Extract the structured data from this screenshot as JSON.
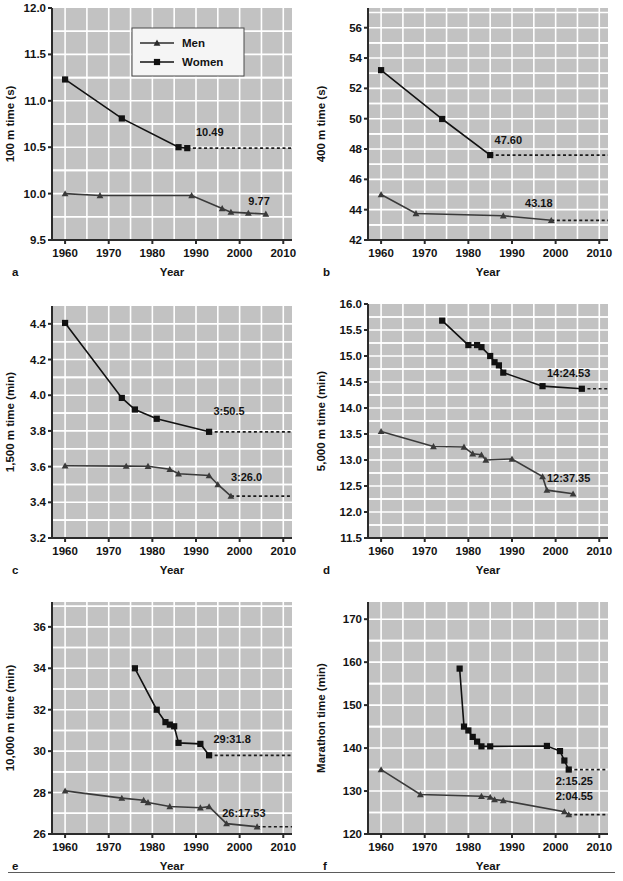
{
  "figure": {
    "title": "",
    "panel_count": 6,
    "legend": {
      "position": "inside panel a, upper area",
      "entries": [
        {
          "label": "Men",
          "marker": "triangle",
          "color": "#2b2b2b"
        },
        {
          "label": "Women",
          "marker": "square",
          "color": "#111111"
        }
      ]
    },
    "style": {
      "plot_background": "#c2c2c2",
      "grid_color": "#ffffff",
      "axis_color": "#2b2b2b",
      "men_color": "#3a3a3a",
      "women_color": "#111111",
      "dashed_color": "#1a1a1a",
      "page_background": "#ffffff",
      "rule_color": "#5b5b5b"
    }
  },
  "chart_data": [
    {
      "panel": "a",
      "type": "line",
      "title": "",
      "xlabel": "Year",
      "ylabel": "100 m time (s)",
      "xlim": [
        1957,
        2012
      ],
      "ylim": [
        9.5,
        12.0
      ],
      "xticks": [
        1960,
        1970,
        1980,
        1990,
        2000,
        2010
      ],
      "xticklabels": [
        "1960",
        "1970",
        "1980",
        "1990",
        "2000",
        "2010"
      ],
      "yticks": [
        9.5,
        10.0,
        10.5,
        11.0,
        11.5,
        12.0
      ],
      "yticklabels": [
        "9.5",
        "10.0",
        "10.5",
        "11.0",
        "11.5",
        "12.0"
      ],
      "grid": true,
      "series": [
        {
          "name": "Men",
          "marker": "triangle",
          "x": [
            1960,
            1968,
            1989,
            1996,
            1998,
            2002,
            2006
          ],
          "y": [
            10.0,
            9.98,
            9.98,
            9.84,
            9.8,
            9.79,
            9.78
          ]
        },
        {
          "name": "Women",
          "marker": "square",
          "x": [
            1960,
            1973,
            1986,
            1988
          ],
          "y": [
            11.23,
            10.81,
            10.5,
            10.49
          ]
        }
      ],
      "annotations": [
        {
          "text": "10.49",
          "x": 1990,
          "y": 10.62,
          "series": "Women"
        },
        {
          "text": "9.77",
          "x": 2002,
          "y": 9.88,
          "series": "Men"
        }
      ],
      "reference_lines": [
        {
          "y": 10.49,
          "from_x": 1988,
          "to_x": 2012,
          "style": "dashed"
        }
      ]
    },
    {
      "panel": "b",
      "type": "line",
      "title": "",
      "xlabel": "Year",
      "ylabel": "400 m time (s)",
      "xlim": [
        1957,
        2012
      ],
      "ylim": [
        42,
        57.3
      ],
      "xticks": [
        1960,
        1970,
        1980,
        1990,
        2000,
        2010
      ],
      "xticklabels": [
        "1960",
        "1970",
        "1980",
        "1990",
        "2000",
        "2010"
      ],
      "yticks": [
        42,
        44,
        46,
        48,
        50,
        52,
        54,
        56
      ],
      "yticklabels": [
        "42",
        "44",
        "46",
        "48",
        "50",
        "52",
        "54",
        "56"
      ],
      "grid": true,
      "series": [
        {
          "name": "Men",
          "marker": "triangle",
          "x": [
            1960,
            1968,
            1988,
            1999
          ],
          "y": [
            45.0,
            43.75,
            43.6,
            43.3
          ]
        },
        {
          "name": "Women",
          "marker": "square",
          "x": [
            1960,
            1974,
            1985
          ],
          "y": [
            53.2,
            49.98,
            47.6
          ]
        }
      ],
      "annotations": [
        {
          "text": "47.60",
          "x": 1986,
          "y": 48.35,
          "series": "Women"
        },
        {
          "text": "43.18",
          "x": 1993,
          "y": 44.15,
          "series": "Men"
        }
      ],
      "reference_lines": [
        {
          "y": 47.6,
          "from_x": 1985,
          "to_x": 2012,
          "style": "dashed"
        },
        {
          "y": 43.3,
          "from_x": 1999,
          "to_x": 2012,
          "style": "dashed"
        }
      ]
    },
    {
      "panel": "c",
      "type": "line",
      "title": "",
      "xlabel": "Year",
      "ylabel": "1,500 m time (min)",
      "xlim": [
        1957,
        2012
      ],
      "ylim": [
        3.2,
        4.5
      ],
      "xticks": [
        1960,
        1970,
        1980,
        1990,
        2000,
        2010
      ],
      "xticklabels": [
        "1960",
        "1970",
        "1980",
        "1990",
        "2000",
        "2010"
      ],
      "yticks": [
        3.2,
        3.4,
        3.6,
        3.8,
        4.0,
        4.2,
        4.4
      ],
      "yticklabels": [
        "3.2",
        "3.4",
        "3.6",
        "3.8",
        "4.0",
        "4.2",
        "4.4"
      ],
      "grid": true,
      "series": [
        {
          "name": "Men",
          "marker": "triangle",
          "x": [
            1960,
            1974,
            1979,
            1984,
            1986,
            1993,
            1995,
            1998
          ],
          "y": [
            3.605,
            3.603,
            3.602,
            3.585,
            3.56,
            3.55,
            3.5,
            3.435
          ]
        },
        {
          "name": "Women",
          "marker": "square",
          "x": [
            1960,
            1973,
            1976,
            1981,
            1993
          ],
          "y": [
            4.405,
            3.985,
            3.92,
            3.868,
            3.795
          ]
        }
      ],
      "annotations": [
        {
          "text": "3:50.5",
          "x": 1994,
          "y": 3.89,
          "series": "Women"
        },
        {
          "text": "3:26.0",
          "x": 1998,
          "y": 3.52,
          "series": "Men"
        }
      ],
      "reference_lines": [
        {
          "y": 3.795,
          "from_x": 1993,
          "to_x": 2012,
          "style": "dashed"
        },
        {
          "y": 3.435,
          "from_x": 1998,
          "to_x": 2012,
          "style": "dashed"
        }
      ]
    },
    {
      "panel": "d",
      "type": "line",
      "title": "",
      "xlabel": "Year",
      "ylabel": "5,000 m time (min)",
      "xlim": [
        1957,
        2012
      ],
      "ylim": [
        11.5,
        16.0
      ],
      "xticks": [
        1960,
        1970,
        1980,
        1990,
        2000,
        2010
      ],
      "xticklabels": [
        "1960",
        "1970",
        "1980",
        "1990",
        "2000",
        "2010"
      ],
      "yticks": [
        11.5,
        12.0,
        12.5,
        13.0,
        13.5,
        14.0,
        14.5,
        15.0,
        15.5,
        16.0
      ],
      "yticklabels": [
        "11.5",
        "12.0",
        "12.5",
        "13.0",
        "13.5",
        "14.0",
        "14.5",
        "15.0",
        "15.5",
        "16.0"
      ],
      "grid": true,
      "series": [
        {
          "name": "Men",
          "marker": "triangle",
          "x": [
            1960,
            1972,
            1979,
            1981,
            1983,
            1984,
            1990,
            1997,
            1998,
            2004
          ],
          "y": [
            13.55,
            13.26,
            13.25,
            13.12,
            13.1,
            13.0,
            13.02,
            12.68,
            12.42,
            12.35
          ]
        },
        {
          "name": "Women",
          "marker": "square",
          "x": [
            1974,
            1980,
            1982,
            1983,
            1985,
            1986,
            1987,
            1988,
            1997,
            2006
          ],
          "y": [
            15.68,
            15.21,
            15.21,
            15.17,
            15.0,
            14.88,
            14.82,
            14.68,
            14.42,
            14.37
          ]
        }
      ],
      "annotations": [
        {
          "text": "14:24.53",
          "x": 1998,
          "y": 14.6,
          "series": "Women"
        },
        {
          "text": "12:37.35",
          "x": 1998,
          "y": 12.58,
          "series": "Men"
        }
      ],
      "reference_lines": [
        {
          "y": 14.37,
          "from_x": 2006,
          "to_x": 2012,
          "style": "dashed"
        }
      ]
    },
    {
      "panel": "e",
      "type": "line",
      "title": "",
      "xlabel": "Year",
      "ylabel": "10,000 m time (min)",
      "xlim": [
        1957,
        2012
      ],
      "ylim": [
        26,
        37.2
      ],
      "xticks": [
        1960,
        1970,
        1980,
        1990,
        2000,
        2010
      ],
      "xticklabels": [
        "1960",
        "1970",
        "1980",
        "1990",
        "2000",
        "2010"
      ],
      "yticks": [
        26,
        28,
        30,
        32,
        34,
        36
      ],
      "yticklabels": [
        "26",
        "28",
        "30",
        "32",
        "34",
        "36"
      ],
      "grid": true,
      "series": [
        {
          "name": "Men",
          "marker": "triangle",
          "x": [
            1960,
            1973,
            1978,
            1979,
            1984,
            1991,
            1993,
            1997,
            2004
          ],
          "y": [
            28.08,
            27.73,
            27.63,
            27.52,
            27.33,
            27.27,
            27.32,
            26.5,
            26.35
          ]
        },
        {
          "name": "Women",
          "marker": "square",
          "x": [
            1976,
            1981,
            1983,
            1984,
            1985,
            1986,
            1991,
            1993
          ],
          "y": [
            34.0,
            32.0,
            31.4,
            31.28,
            31.2,
            30.4,
            30.35,
            29.8
          ]
        }
      ],
      "annotations": [
        {
          "text": "29:31.8",
          "x": 1994,
          "y": 30.4,
          "series": "Women"
        },
        {
          "text": "26:17.53",
          "x": 1996,
          "y": 26.82,
          "series": "Men"
        }
      ],
      "reference_lines": [
        {
          "y": 29.8,
          "from_x": 1993,
          "to_x": 2012,
          "style": "dashed"
        },
        {
          "y": 26.35,
          "from_x": 2004,
          "to_x": 2012,
          "style": "dashed"
        }
      ]
    },
    {
      "panel": "f",
      "type": "line",
      "title": "",
      "xlabel": "Year",
      "ylabel": "Marathon time (min)",
      "xlim": [
        1957,
        2012
      ],
      "ylim": [
        120,
        174
      ],
      "xticks": [
        1960,
        1970,
        1980,
        1990,
        2000,
        2010
      ],
      "xticklabels": [
        "1960",
        "1970",
        "1980",
        "1990",
        "2000",
        "2010"
      ],
      "yticks": [
        120,
        130,
        140,
        150,
        160,
        170
      ],
      "yticklabels": [
        "120",
        "130",
        "140",
        "150",
        "160",
        "170"
      ],
      "grid": true,
      "series": [
        {
          "name": "Men",
          "marker": "triangle",
          "x": [
            1960,
            1969,
            1983,
            1985,
            1986,
            1988,
            2002,
            2003
          ],
          "y": [
            135.0,
            129.2,
            128.8,
            128.6,
            128.0,
            127.8,
            125.2,
            124.5
          ]
        },
        {
          "name": "Women",
          "marker": "square",
          "x": [
            1978,
            1979,
            1980,
            1981,
            1982,
            1983,
            1985,
            1998,
            2001,
            2002,
            2003
          ],
          "y": [
            158.5,
            145.0,
            144.1,
            142.6,
            141.5,
            140.4,
            140.4,
            140.5,
            139.3,
            137.1,
            135.0
          ]
        }
      ],
      "annotations": [
        {
          "text": "2:15.25",
          "x": 2000,
          "y": 131.5,
          "series": "Women"
        },
        {
          "text": "2:04.55",
          "x": 2000,
          "y": 128.0,
          "series": "Men"
        }
      ],
      "reference_lines": [
        {
          "y": 135.0,
          "from_x": 2003,
          "to_x": 2012,
          "style": "dashed"
        },
        {
          "y": 124.5,
          "from_x": 2003,
          "to_x": 2012,
          "style": "dashed"
        }
      ]
    }
  ],
  "panel_letters": [
    "a",
    "b",
    "c",
    "d",
    "e",
    "f"
  ]
}
